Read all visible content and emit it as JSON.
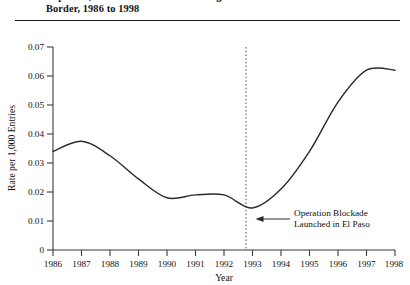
{
  "figure": {
    "title_lines": [
      "Exposure, and Unknown Causes Along the Mexico-U.S.",
      "Border, 1986 to 1998"
    ]
  },
  "chart_data": {
    "type": "line",
    "title": "Exposure, and Unknown Causes Along the Mexico-U.S. Border, 1986 to 1998",
    "xlabel": "Year",
    "ylabel": "Rate per 1,000 Entries",
    "xlim": [
      1986,
      1998
    ],
    "ylim": [
      0,
      0.07
    ],
    "grid": false,
    "legend": "none",
    "x_tick_labels": [
      "1986",
      "1987",
      "1988",
      "1989",
      "1990",
      "1991",
      "1992",
      "1993",
      "1994",
      "1995",
      "1996",
      "1997",
      "1998"
    ],
    "y_tick_labels": [
      "0",
      "0.01",
      "0.02",
      "0.03",
      "0.04",
      "0.05",
      "0.06",
      "0.07"
    ],
    "y_ticks": [
      0,
      0.01,
      0.02,
      0.03,
      0.04,
      0.05,
      0.06,
      0.07
    ],
    "x": [
      1986,
      1987,
      1988,
      1989,
      1990,
      1991,
      1992,
      1993,
      1994,
      1995,
      1996,
      1997,
      1998
    ],
    "values": [
      0.034,
      0.0375,
      0.0325,
      0.0245,
      0.018,
      0.019,
      0.019,
      0.0145,
      0.021,
      0.034,
      0.051,
      0.062,
      0.062
    ],
    "series": [
      {
        "name": "Rate per 1,000 Entries",
        "values": [
          0.034,
          0.0375,
          0.0325,
          0.0245,
          0.018,
          0.019,
          0.019,
          0.0145,
          0.021,
          0.034,
          0.051,
          0.062,
          0.062
        ]
      }
    ],
    "annotations": [
      {
        "name": "operation-blockade",
        "x": 1993,
        "text_lines": [
          "Operation Blockade",
          "Launched in El Paso"
        ],
        "marker": "dotted-vertical-line-with-left-arrow"
      }
    ]
  },
  "annotation": {
    "line1": "Operation Blockade",
    "line2": "Launched in El Paso"
  },
  "axes": {
    "x_title": "Year",
    "y_title": "Rate per 1,000 Entries"
  }
}
